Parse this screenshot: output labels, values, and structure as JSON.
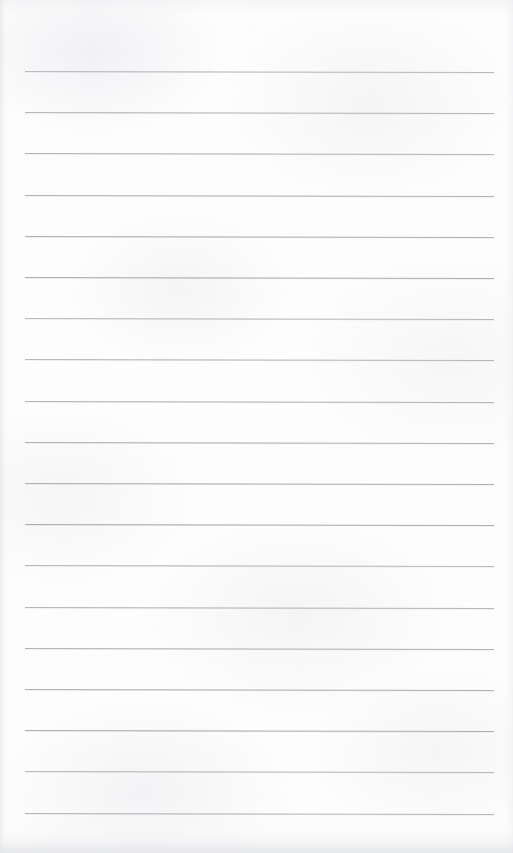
{
  "document": {
    "kind": "scanned-page",
    "title": "Blank ruled notebook page",
    "page_width": 513,
    "page_height": 853,
    "background_color": "#fefefe",
    "text_content": "",
    "visible_text": [],
    "header": "",
    "footer": "",
    "page_number": "",
    "annotations": []
  },
  "ruling": {
    "line_color": "#a9abad",
    "line_thickness_px": 1,
    "line_count": 19,
    "left_x": 25,
    "right_x": 494,
    "first_line_y": 71,
    "line_spacing_px": 41.2,
    "tilt_deg": 0.12,
    "line_y_positions": [
      71,
      112,
      153,
      195,
      236,
      277,
      318,
      359,
      401,
      442,
      483,
      524,
      565,
      607,
      648,
      689,
      730,
      771,
      813
    ],
    "margin_rule": "none",
    "ruling_style": "horizontal-ruled"
  },
  "scan": {
    "paper_tone": "#fdfdfe",
    "left_edge_shadow": "#dedfe2",
    "right_edge_shadow": "#e6e7e9",
    "bottom_edge_shadow": "#e2e3e6",
    "grain": "fine-speckle"
  }
}
